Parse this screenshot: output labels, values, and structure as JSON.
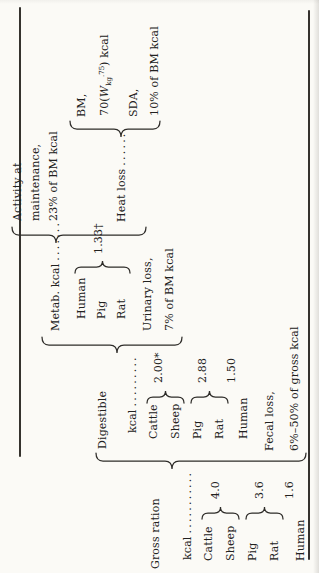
{
  "colors": {
    "paper": "#fbfaf6",
    "ink": "#222120"
  },
  "gross": {
    "line1": "Gross ration",
    "kcal": "kcal",
    "dots": "...........",
    "species": {
      "cattle": "Cattle",
      "sheep": "Sheep",
      "pig": "Pig",
      "rat": "Rat",
      "human": "Human"
    },
    "values": {
      "cattle_sheep": "4.0",
      "pig_rat": "3.6",
      "human": "1.6"
    }
  },
  "digestible": {
    "line1": "Digestible",
    "kcal": "kcal",
    "dots": ".........",
    "species": {
      "cattle": "Cattle",
      "sheep": "Sheep",
      "pig": "Pig",
      "rat": "Rat",
      "human": "Human"
    },
    "values": {
      "cattle_sheep": "2.00*",
      "pig_rat": "2.88",
      "human": "1.50"
    }
  },
  "fecal": {
    "line1": "Fecal loss,",
    "line2": "6%–50% of gross kcal"
  },
  "metab": {
    "label": "Metab. kcal",
    "dots": ".......",
    "species": {
      "human": "Human",
      "pig": "Pig",
      "rat": "Rat"
    },
    "value": "1.33†"
  },
  "urinary": {
    "line1": "Urinary loss,",
    "line2": "7% of BM kcal"
  },
  "activity": {
    "line1": "Activity at",
    "line2": "maintenance,",
    "line3": "23% of BM kcal"
  },
  "heat": {
    "label": "Heat loss",
    "dots": "......"
  },
  "bm": {
    "line1": "BM,",
    "formula": {
      "pre": "70(",
      "var": "W",
      "sub": "kg",
      "sup": ".75",
      "post": ") kcal"
    }
  },
  "sda": {
    "line1": "SDA,",
    "line2": "10% of BM kcal"
  }
}
